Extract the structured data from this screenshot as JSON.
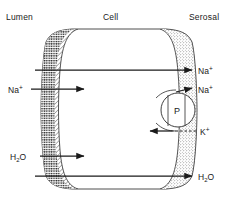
{
  "figure": {
    "background_color": "#ffffff",
    "ink_color": "#1a1a1a"
  },
  "columns": [
    {
      "id": "lumen",
      "label": "Lumen"
    },
    {
      "id": "cell",
      "label": "Cell"
    },
    {
      "id": "serosal",
      "label": "Serosal"
    }
  ],
  "membranes": {
    "luminal": {
      "name": "luminal-membrane",
      "texture": "diagonal-hatch",
      "brush_border": "stippled-dark-edge"
    },
    "serosal": {
      "name": "serosal-membrane",
      "texture": "stipple-dots"
    }
  },
  "pump": {
    "label": "P",
    "name": "sodium-potassium-pump"
  },
  "transport_paths": [
    {
      "id": "na-transcellular",
      "label_parts": {
        "base": "Na",
        "sup": "+"
      },
      "label": "Na+",
      "direction": "lumen-to-serosal",
      "style": "solid"
    },
    {
      "id": "na-entry",
      "label_parts": {
        "base": "Na",
        "sup": "+"
      },
      "label": "Na+",
      "direction": "lumen-into-cell",
      "style": "solid"
    },
    {
      "id": "na-pump-exit",
      "label_parts": {
        "base": "Na",
        "sup": "+"
      },
      "label": "Na+",
      "direction": "cell-to-serosal",
      "style": "solid-with-dash"
    },
    {
      "id": "k-pump-entry",
      "label_parts": {
        "base": "K",
        "sup": "+"
      },
      "label": "K+",
      "direction": "serosal-into-cell",
      "style": "dashed"
    },
    {
      "id": "h2o-entry",
      "label_parts": {
        "base": "H",
        "sub": "2",
        "post": "O"
      },
      "label": "H2O",
      "direction": "lumen-into-cell",
      "style": "solid"
    },
    {
      "id": "h2o-transcellular",
      "label_parts": {
        "base": "H",
        "sub": "2",
        "post": "O"
      },
      "label": "H2O",
      "direction": "lumen-to-serosal",
      "style": "solid"
    }
  ]
}
